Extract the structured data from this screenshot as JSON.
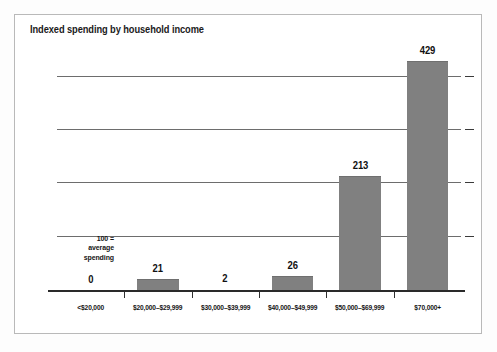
{
  "chart_data": {
    "type": "bar",
    "title": "Indexed spending by household income",
    "xlabel": "",
    "ylabel": "",
    "categories": [
      "<$20,000",
      "$20,000–$29,999",
      "$30,000–$39,999",
      "$40,000–$49,999",
      "$50,000–$69,999",
      "$70,000+"
    ],
    "values": [
      0,
      21,
      2,
      26,
      213,
      429
    ],
    "value_labels": [
      "0",
      "21",
      "2",
      "26",
      "213",
      "429"
    ],
    "ylim": [
      0,
      450
    ],
    "gridlines": [
      100,
      200,
      300,
      400
    ],
    "grid": true,
    "legend": "none",
    "annotation": {
      "line1": "100 =",
      "line2": "average",
      "line3": "spending",
      "at_value": 100
    },
    "bar_color": "#808080",
    "axis_color": "#2a2a2a",
    "grid_color": "#6d6d6d",
    "text_color": "#141414"
  }
}
